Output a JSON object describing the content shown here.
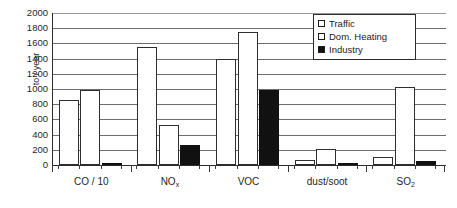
{
  "chart_data": {
    "type": "bar",
    "title": "",
    "subtitle": "",
    "xlabel": "",
    "ylabel": "to / year",
    "ylim": [
      0,
      2000
    ],
    "ytick_step": 200,
    "yticks": [
      2000,
      1800,
      1600,
      1400,
      1200,
      1000,
      800,
      600,
      400,
      200,
      0
    ],
    "ytick_labels": [
      "2000",
      "1800",
      "1600",
      "1400",
      "1200",
      "1000",
      "800",
      "600",
      "400",
      "200",
      "0"
    ],
    "grid": true,
    "grid_axis": "y",
    "legend_position": "top-right",
    "categories": [
      "CO / 10",
      "NOx",
      "VOC",
      "dust/soot",
      "SO2"
    ],
    "category_labels_html": [
      "CO / 10",
      "NO<sub>x</sub>",
      "VOC",
      "dust/soot",
      "SO<sub>2</sub>"
    ],
    "series": [
      {
        "name": "Traffic",
        "color": "#ffffff",
        "edge_color": "#2e2e2e",
        "values": [
          850,
          1550,
          1390,
          65,
          110
        ]
      },
      {
        "name": "Dom. Heating",
        "color": "#ffffff",
        "edge_color": "#2e2e2e",
        "values": [
          990,
          520,
          1750,
          215,
          1020
        ]
      },
      {
        "name": "Industry",
        "color": "#111111",
        "edge_color": "#111111",
        "values": [
          25,
          260,
          990,
          30,
          50
        ]
      }
    ]
  },
  "legend": {
    "items": [
      {
        "label": "Traffic",
        "swatch": "hollow"
      },
      {
        "label": "Dom. Heating",
        "swatch": "hollow"
      },
      {
        "label": "Industry",
        "swatch": "filled"
      }
    ]
  }
}
